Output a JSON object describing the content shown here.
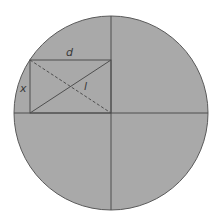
{
  "diagram": {
    "type": "geometry",
    "circle": {
      "cx": 111,
      "cy": 113,
      "r": 97,
      "fill": "#a9a9a9",
      "stroke": "#5a5a5a"
    },
    "axes": {
      "horizontal": {
        "x1": 14,
        "y1": 113,
        "x2": 208,
        "y2": 113
      },
      "vertical": {
        "x1": 111,
        "y1": 16,
        "x2": 111,
        "y2": 210
      }
    },
    "rectangle": {
      "x": 30,
      "y": 60,
      "width": 81,
      "height": 53
    },
    "diagonals": {
      "solid": {
        "x1": 30,
        "y1": 113,
        "x2": 111,
        "y2": 60
      },
      "dashed": {
        "x1": 30,
        "y1": 60,
        "x2": 111,
        "y2": 113
      }
    },
    "labels": {
      "d": "d",
      "x": "x",
      "l": "l"
    },
    "colors": {
      "fill": "#a9a9a9",
      "line": "#4f4f4f",
      "text": "#3a3a3a"
    }
  }
}
